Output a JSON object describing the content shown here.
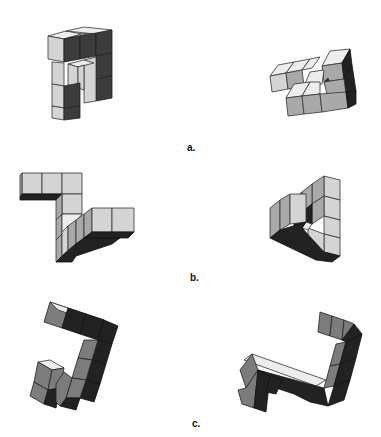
{
  "figure": {
    "type": "mental-rotation-stimuli",
    "pairs": [
      {
        "label": "a.",
        "left": "block-figure-a-left",
        "right": "block-figure-a-right"
      },
      {
        "label": "b.",
        "left": "block-figure-b-left",
        "right": "block-figure-b-right"
      },
      {
        "label": "c.",
        "left": "block-figure-c-left",
        "right": "block-figure-c-right"
      }
    ]
  },
  "colors": {
    "background": "#ffffff",
    "face_light": "#d4d4d4",
    "face_mid": "#a9a9a9",
    "face_dark": "#3c3c3c",
    "edge": "#333333"
  }
}
